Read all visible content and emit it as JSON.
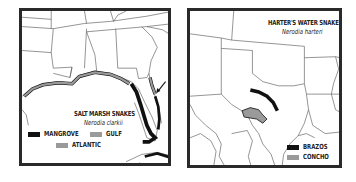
{
  "maps": [
    {
      "id": "salt-marsh",
      "title": "SALT MARSH SNAKES",
      "scientific_name": "Nerodia clarkii",
      "legend": [
        {
          "label": "MANGROVE",
          "color": "#111111"
        },
        {
          "label": "GULF",
          "color": "#9a9a9a"
        },
        {
          "label": "ATLANTIC",
          "color": "#9a9a9a"
        }
      ],
      "annotation": "arrow pointing to Atlantic coast of Florida"
    },
    {
      "id": "harters-water",
      "title": "HARTER'S WATER SNAKES",
      "scientific_name": "Nerodia harteri",
      "legend": [
        {
          "label": "BRAZOS",
          "color": "#111111"
        },
        {
          "label": "CONCHO",
          "color": "#9a9a9a"
        }
      ]
    }
  ],
  "colors": {
    "range_dark": "#111111",
    "range_gray": "#9a9a9a",
    "border": "#2a2a2a",
    "lines": "#555555"
  }
}
